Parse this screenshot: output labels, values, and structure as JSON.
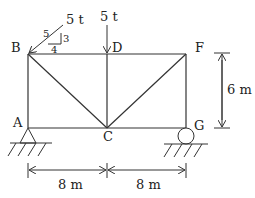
{
  "diagram": {
    "type": "truss",
    "nodes": {
      "A": "A",
      "B": "B",
      "C": "C",
      "D": "D",
      "F": "F",
      "G": "G"
    },
    "loads": {
      "inclined_load": "5 t",
      "vertical_load": "5 t",
      "slope_hyp": "5",
      "slope_rise": "3",
      "slope_run": "4"
    },
    "dimensions": {
      "height": "6 m",
      "span_left": "8 m",
      "span_right": "8 m"
    },
    "colors": {
      "line": "#333333",
      "text": "#222222"
    }
  }
}
